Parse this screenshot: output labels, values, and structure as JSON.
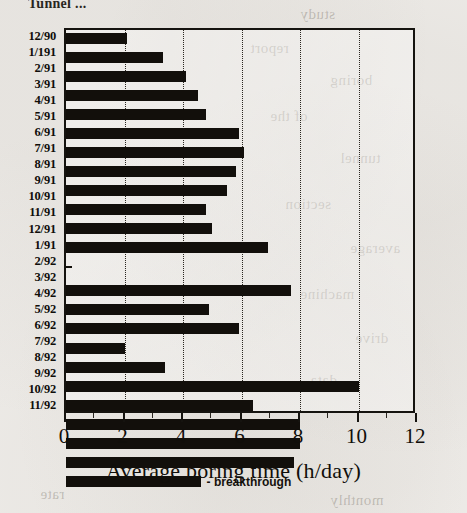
{
  "chart_title": "Tunnel ...",
  "axis": {
    "x_title": "Average boring time (h/day)",
    "x_ticks": [
      "0",
      "2",
      "4",
      "6",
      "8",
      "10",
      "12"
    ],
    "x_min": 0,
    "x_max": 12,
    "x_major_step": 2,
    "x_minor_step": 1
  },
  "annotation": {
    "breakthrough_label": "- breakthrough",
    "breakthrough_category": "11/92"
  },
  "chart_data": {
    "type": "bar",
    "orientation": "horizontal",
    "title": "Tunnel ...",
    "xlabel": "Average boring time (h/day)",
    "ylabel": "",
    "xlim": [
      0,
      12
    ],
    "grid": true,
    "legend": "none",
    "categories": [
      "12/90",
      "1/191",
      "2/91",
      "3/91",
      "4/91",
      "5/91",
      "6/91",
      "7/91",
      "8/91",
      "9/91",
      "10/91",
      "11/91",
      "12/91",
      "1/91",
      "2/92",
      "3/92",
      "4/92",
      "5/92",
      "6/92",
      "7/92",
      "8/92",
      "9/92",
      "10/92",
      "11/92"
    ],
    "values": [
      2.1,
      3.3,
      4.1,
      4.5,
      4.8,
      5.9,
      6.1,
      5.8,
      5.5,
      4.8,
      5.0,
      6.9,
      0.0,
      7.7,
      4.9,
      5.9,
      2.0,
      3.4,
      10.0,
      6.4,
      8.0,
      8.0,
      7.8,
      4.6
    ],
    "annotations": [
      {
        "category": "11/92",
        "text": "- breakthrough"
      }
    ],
    "value_units": "h/day"
  },
  "ghost_text": {
    "lines": [
      "study",
      "report",
      "boring",
      "of the",
      "tunnel",
      "section",
      "average",
      "machine",
      "drive",
      "data",
      "rate",
      "monthly"
    ]
  }
}
